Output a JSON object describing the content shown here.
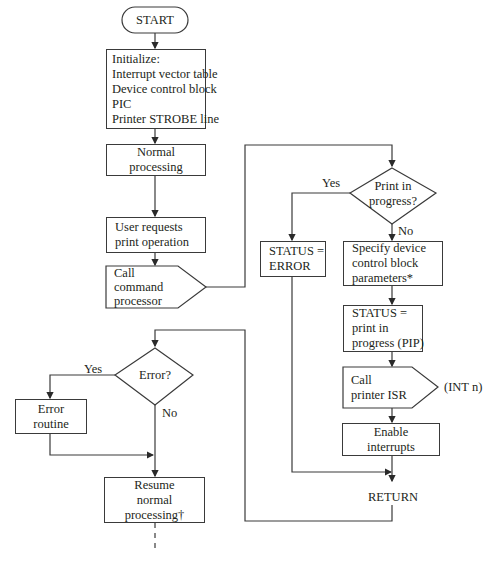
{
  "start": {
    "label": "START"
  },
  "initialize": {
    "lines": [
      "Initialize:",
      "Interrupt vector table",
      "Device control block",
      "PIC",
      "Printer STROBE line"
    ]
  },
  "normal_processing": {
    "lines": [
      "Normal",
      "processing"
    ]
  },
  "user_requests": {
    "lines": [
      "User requests",
      "print operation"
    ]
  },
  "call_command": {
    "lines": [
      "Call",
      "command",
      "processor"
    ]
  },
  "print_decision": {
    "lines": [
      "Print in",
      "progress?"
    ],
    "yes": "Yes",
    "no": "No"
  },
  "status_error": {
    "lines": [
      "STATUS =",
      "ERROR"
    ]
  },
  "specify_dcb": {
    "lines": [
      "Specify device",
      "control block",
      "parameters*"
    ]
  },
  "status_pip": {
    "lines": [
      "STATUS =",
      "print in",
      "progress (PIP)"
    ]
  },
  "call_isr": {
    "lines": [
      "Call",
      "printer ISR"
    ],
    "annotation": "(INT n)"
  },
  "enable_interrupts": {
    "lines": [
      "Enable",
      "interrupts"
    ]
  },
  "return": {
    "label": "RETURN"
  },
  "error_decision": {
    "label": "Error?",
    "yes": "Yes",
    "no": "No"
  },
  "error_routine": {
    "lines": [
      "Error",
      "routine"
    ]
  },
  "resume": {
    "lines": [
      "Resume",
      "normal",
      "processing†"
    ]
  }
}
